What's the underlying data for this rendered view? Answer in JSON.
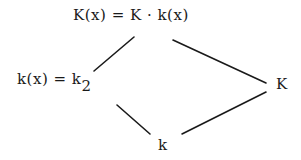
{
  "diagram": {
    "nodes": {
      "top": {
        "label": "K(x) = K · k(x)"
      },
      "left": {
        "label": "k(x) = k",
        "subscript": "2"
      },
      "right": {
        "label": "K"
      },
      "bottom": {
        "label": "k"
      }
    },
    "edges": [
      {
        "from": "top",
        "to": "left"
      },
      {
        "from": "top",
        "to": "right"
      },
      {
        "from": "left",
        "to": "bottom"
      },
      {
        "from": "right",
        "to": "bottom"
      }
    ]
  }
}
